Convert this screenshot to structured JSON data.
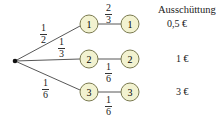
{
  "header": {
    "title": "Ausschüttung"
  },
  "root": {
    "x": 15,
    "y": 61
  },
  "colors": {
    "node_fill": "#f2f2d0",
    "node_stroke": "#7a7a50",
    "edge": "#444444"
  },
  "nodes_level1": [
    {
      "label": "1",
      "x": 89,
      "y": 24
    },
    {
      "label": "2",
      "x": 89,
      "y": 59
    },
    {
      "label": "3",
      "x": 89,
      "y": 92
    }
  ],
  "nodes_level2": [
    {
      "label": "1",
      "x": 130,
      "y": 24
    },
    {
      "label": "2",
      "x": 130,
      "y": 59
    },
    {
      "label": "3",
      "x": 130,
      "y": 92
    }
  ],
  "edges_level1": [
    {
      "num": "1",
      "den": "2"
    },
    {
      "num": "1",
      "den": "3"
    },
    {
      "num": "1",
      "den": "6"
    }
  ],
  "edges_level2": [
    {
      "num": "2",
      "den": "3"
    },
    {
      "num": "1",
      "den": "6"
    },
    {
      "num": "1",
      "den": "6"
    }
  ],
  "payouts": [
    "0,5 €",
    "1 €",
    "3 €"
  ]
}
